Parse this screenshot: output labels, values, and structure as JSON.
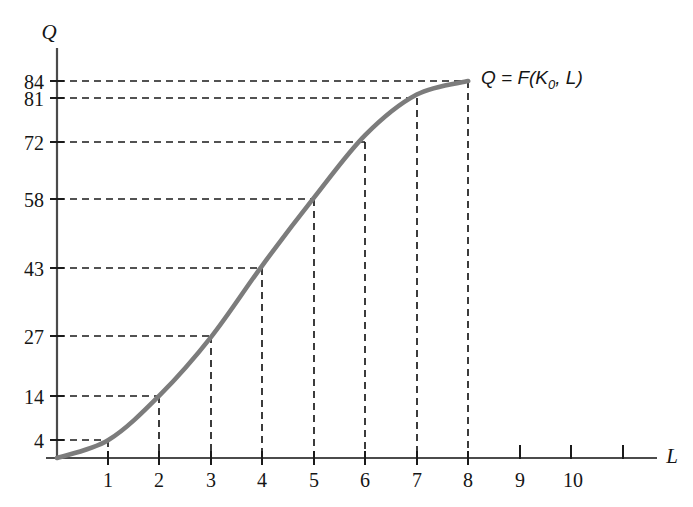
{
  "chart_data": {
    "type": "line",
    "title": "",
    "subtitle": "",
    "xlabel": "L",
    "ylabel": "Q",
    "xlim": [
      0,
      11.6
    ],
    "ylim": [
      0,
      92
    ],
    "grid": false,
    "legend_position": "inline-right-of-curve-endpoint",
    "annotations": [
      {
        "text": "Q = F(K0, L)",
        "x": 8.2,
        "y": 84
      }
    ],
    "series": [
      {
        "name": "Q = F(K0, L)",
        "color": "#7c7c7c",
        "x": [
          0,
          1,
          2,
          3,
          4,
          5,
          6,
          7,
          8
        ],
        "values": [
          0,
          4,
          14,
          27,
          43,
          58,
          72,
          81,
          84
        ]
      }
    ],
    "x_ticks": [
      1,
      2,
      3,
      4,
      5,
      6,
      7,
      8,
      9,
      10,
      11
    ],
    "x_tick_labels": [
      "1",
      "2",
      "3",
      "4",
      "5",
      "6",
      "7",
      "8",
      "9",
      "10",
      ""
    ],
    "y_ticks": [
      4,
      14,
      27,
      43,
      58,
      72,
      81,
      84
    ],
    "y_tick_labels": [
      "4",
      "14",
      "27",
      "43",
      "58",
      "72",
      "81",
      "84"
    ],
    "guide_lines": [
      {
        "x": 1,
        "y": 4
      },
      {
        "x": 2,
        "y": 14
      },
      {
        "x": 3,
        "y": 27
      },
      {
        "x": 4,
        "y": 43
      },
      {
        "x": 5,
        "y": 58
      },
      {
        "x": 6,
        "y": 72
      },
      {
        "x": 7,
        "y": 81
      },
      {
        "x": 8,
        "y": 84
      }
    ]
  },
  "labels": {
    "y_axis": "Q",
    "x_axis": "L",
    "curve_q": "Q",
    "curve_eq": " = F(K",
    "curve_sub": "0",
    "curve_tail": ", L)"
  },
  "colors": {
    "curve": "#7c7c7c",
    "axis": "#4b4b4b",
    "dash": "#1a1a1a",
    "text": "#151515",
    "background": "#ffffff"
  }
}
